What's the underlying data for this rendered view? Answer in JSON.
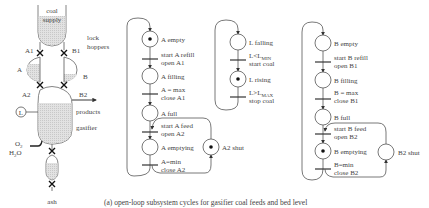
{
  "plant": {
    "coal_supply_line1": "coal",
    "coal_supply_line2": "supply",
    "lock_hoppers_line1": "lock",
    "lock_hoppers_line2": "hoppers",
    "valve_A1": "A1",
    "valve_B1": "B1",
    "hopper_A": "A",
    "hopper_B": "B",
    "valve_A2": "A2",
    "valve_B2": "B2",
    "level_sensor": "L",
    "products": "products",
    "gasifier": "gasifier",
    "o2": "O",
    "o2_sub": "2",
    "h2o_h": "H",
    "h2o_sub": "2",
    "h2o_o": "O",
    "ash": "ash"
  },
  "net_a": {
    "places": [
      {
        "label": "A empty",
        "token": true
      },
      {
        "label": "A filling",
        "token": false
      },
      {
        "label": "A full",
        "token": false
      },
      {
        "label": "A emptying",
        "token": false
      }
    ],
    "transitions": [
      {
        "line1": "start A refill",
        "line2": "open A1"
      },
      {
        "line1": "A = max",
        "line2": "close A1"
      },
      {
        "line1": "start A feed",
        "line2": "open A2"
      },
      {
        "line1": "A=min",
        "line2": "close A2"
      }
    ],
    "side_place": {
      "label": "A2 shut",
      "token": true
    }
  },
  "net_l": {
    "places": [
      {
        "label": "L falling",
        "token": false
      },
      {
        "label": "L rising",
        "token": true
      }
    ],
    "transitions": [
      {
        "line1_main": "L<L",
        "line1_sub": "MIN",
        "line2": "start coal"
      },
      {
        "line1_main": "L>L",
        "line1_sub": "MAX",
        "line2": "stop coal"
      }
    ]
  },
  "net_b": {
    "places": [
      {
        "label": "B empty",
        "token": false
      },
      {
        "label": "B filling",
        "token": false
      },
      {
        "label": "B full",
        "token": false
      },
      {
        "label": "B emptying",
        "token": true
      }
    ],
    "transitions": [
      {
        "line1": "start B refill",
        "line2": "open B1"
      },
      {
        "line1": "B = max",
        "line2": "close B1"
      },
      {
        "line1": "start B feed",
        "line2": "open B2"
      },
      {
        "line1": "B=min",
        "line2": "close B2"
      }
    ],
    "side_place": {
      "label": "B2 shut",
      "token": false
    }
  },
  "caption": "(a) open-loop subsystem cycles for gasifier coal feeds and bed level"
}
